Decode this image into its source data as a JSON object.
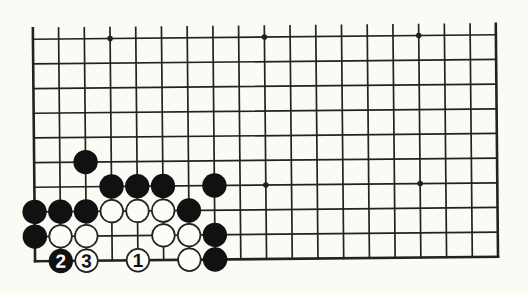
{
  "diagram": {
    "type": "go-board-partial",
    "board_size": 19,
    "visible_columns": 19,
    "visible_rows": 10,
    "edges_shown": [
      "left",
      "right",
      "bottom"
    ],
    "open_edge": "top",
    "colors": {
      "background": "#fbfbf5",
      "line": "#222222",
      "black_stone": "#111111",
      "white_stone_fill": "#fdfdf8",
      "white_stone_stroke": "#222222",
      "label_on_black": "#ffffff",
      "label_on_white": "#111111"
    },
    "geometry": {
      "origin_x": 34,
      "origin_y": 37,
      "spacing_x": 25.72,
      "spacing_y": 24.67,
      "overhang_top": 11,
      "stone_radius": 12.2,
      "star_radius": 2.8,
      "rotation_deg": -0.55
    },
    "star_points": [
      {
        "col": 3,
        "row": 0
      },
      {
        "col": 9,
        "row": 0
      },
      {
        "col": 15,
        "row": 0
      },
      {
        "col": 9,
        "row": 6
      },
      {
        "col": 15,
        "row": 6
      }
    ],
    "stones": [
      {
        "color": "black",
        "col": 2,
        "row": 5,
        "label": ""
      },
      {
        "color": "black",
        "col": 3,
        "row": 6,
        "label": ""
      },
      {
        "color": "black",
        "col": 4,
        "row": 6,
        "label": ""
      },
      {
        "color": "black",
        "col": 5,
        "row": 6,
        "label": ""
      },
      {
        "color": "black",
        "col": 7,
        "row": 6,
        "label": ""
      },
      {
        "color": "black",
        "col": 0,
        "row": 7,
        "label": ""
      },
      {
        "color": "black",
        "col": 1,
        "row": 7,
        "label": ""
      },
      {
        "color": "black",
        "col": 2,
        "row": 7,
        "label": ""
      },
      {
        "color": "white",
        "col": 3,
        "row": 7,
        "label": ""
      },
      {
        "color": "white",
        "col": 4,
        "row": 7,
        "label": ""
      },
      {
        "color": "white",
        "col": 5,
        "row": 7,
        "label": ""
      },
      {
        "color": "black",
        "col": 6,
        "row": 7,
        "label": ""
      },
      {
        "color": "black",
        "col": 0,
        "row": 8,
        "label": ""
      },
      {
        "color": "white",
        "col": 1,
        "row": 8,
        "label": ""
      },
      {
        "color": "white",
        "col": 2,
        "row": 8,
        "label": ""
      },
      {
        "color": "white",
        "col": 5,
        "row": 8,
        "label": ""
      },
      {
        "color": "white",
        "col": 6,
        "row": 8,
        "label": ""
      },
      {
        "color": "black",
        "col": 7,
        "row": 8,
        "label": ""
      },
      {
        "color": "black",
        "col": 1,
        "row": 9,
        "label": "2"
      },
      {
        "color": "white",
        "col": 2,
        "row": 9,
        "label": "3"
      },
      {
        "color": "white",
        "col": 4,
        "row": 9,
        "label": "1"
      },
      {
        "color": "white",
        "col": 6,
        "row": 9,
        "label": ""
      },
      {
        "color": "black",
        "col": 7,
        "row": 9,
        "label": ""
      }
    ],
    "move_sequence": [
      {
        "move": "1",
        "color": "white",
        "col": 4,
        "row": 9
      },
      {
        "move": "2",
        "color": "black",
        "col": 1,
        "row": 9
      },
      {
        "move": "3",
        "color": "white",
        "col": 2,
        "row": 9
      }
    ]
  }
}
